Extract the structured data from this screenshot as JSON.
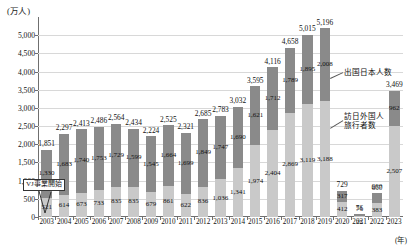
{
  "chart_data": {
    "type": "bar",
    "title": "",
    "subtitle": "",
    "xlabel": "(年)",
    "ylabel": "(万人)",
    "ylim": [
      0,
      5500
    ],
    "ytick_values": [
      0,
      500,
      1000,
      1500,
      2000,
      2500,
      3000,
      3500,
      4000,
      4500,
      5000
    ],
    "ytick_labels": [
      "0",
      "500",
      "1,000",
      "1,500",
      "2,000",
      "2,500",
      "3,000",
      "3,500",
      "4,000",
      "4,500",
      "5,000"
    ],
    "grid": true,
    "stacked": true,
    "legend_position": "right-inside",
    "categories": [
      "2003",
      "2004",
      "2005",
      "2006",
      "2007",
      "2008",
      "2009",
      "2010",
      "2011",
      "2012",
      "2013",
      "2014",
      "2015",
      "2016",
      "2017",
      "2018",
      "2019",
      "2020",
      "2021",
      "2022",
      "2023"
    ],
    "series": [
      {
        "name": "訪日外国人旅行者数",
        "color": "#c9c9c9",
        "values": [
          521,
          614,
          673,
          733,
          835,
          835,
          679,
          861,
          622,
          836,
          1036,
          1341,
          1974,
          2404,
          2869,
          3119,
          3188,
          412,
          25,
          383,
          2507
        ]
      },
      {
        "name": "出国日本人数",
        "color": "#8a8a8a",
        "values": [
          1330,
          1683,
          1740,
          1753,
          1729,
          1599,
          1545,
          1664,
          1699,
          1849,
          1747,
          1690,
          1621,
          1712,
          1789,
          1895,
          2008,
          317,
          51,
          277,
          962
        ]
      }
    ],
    "totals": [
      1851,
      2297,
      2413,
      2486,
      2564,
      2434,
      2224,
      2525,
      2321,
      2685,
      2783,
      3032,
      3595,
      4116,
      4658,
      5015,
      5196,
      729,
      76,
      660,
      3469
    ],
    "total_labels": [
      "1,851",
      "2,297",
      "2,413",
      "2,486",
      "2,564",
      "2,434",
      "2,224",
      "2,525",
      "2,321",
      "2,685",
      "2,783",
      "3,032",
      "3,595",
      "4,116",
      "4,658",
      "5,015",
      "5,196",
      "729",
      "76",
      "660",
      "3,469"
    ],
    "series_labels": {
      "outbound": [
        "1,330",
        "1,683",
        "1,740",
        "1,753",
        "1,729",
        "1,599",
        "1,545",
        "1,664",
        "1,699",
        "1,849",
        "1,747",
        "1,690",
        "1,621",
        "1,712",
        "1,789",
        "1,895",
        "2,008",
        "317",
        "51",
        "277",
        "962"
      ],
      "inbound": [
        "521",
        "614",
        "673",
        "733",
        "835",
        "835",
        "679",
        "861",
        "622",
        "836",
        "1,036",
        "1,341",
        "1,974",
        "2,404",
        "2,869",
        "3,119",
        "3,188",
        "412",
        "25",
        "383",
        "2,507"
      ]
    },
    "annotations": [
      {
        "name": "vj-start",
        "text": "VJ事業開始",
        "at_category": "2003"
      }
    ],
    "legend": [
      {
        "name": "出国日本人数"
      },
      {
        "name": "訪日外国人旅行者数"
      }
    ]
  }
}
